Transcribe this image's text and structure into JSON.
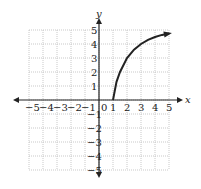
{
  "chart_data": {
    "type": "line",
    "title": "",
    "xlabel": "x",
    "ylabel": "y",
    "xlim": [
      -5,
      5
    ],
    "ylim": [
      -5,
      5
    ],
    "grid": true,
    "x_ticks": [
      "-5",
      "-4",
      "-3",
      "-2",
      "-1",
      "0",
      "1",
      "2",
      "3",
      "4",
      "5"
    ],
    "y_ticks": [
      "5",
      "4",
      "3",
      "2",
      "1",
      "-1",
      "-2",
      "-3",
      "-4",
      "-5"
    ],
    "series": [
      {
        "name": "curve",
        "x": [
          1,
          1.25,
          1.5,
          2,
          2.5,
          3,
          3.5,
          4,
          4.5,
          5
        ],
        "y": [
          0,
          1.3,
          2.0,
          3.0,
          3.6,
          4.0,
          4.3,
          4.5,
          4.65,
          4.75
        ],
        "start_point": [
          1,
          0
        ],
        "end_arrow": true
      }
    ]
  },
  "labels": {
    "x_axis": "x",
    "y_axis": "y",
    "origin": "0",
    "x_neg": [
      "−5",
      "−4",
      "−3",
      "−2",
      "−1"
    ],
    "x_pos": [
      "1",
      "2",
      "3",
      "4",
      "5"
    ],
    "y_pos": [
      "1",
      "2",
      "3",
      "4",
      "5"
    ],
    "y_neg": [
      "−1",
      "−2",
      "−3",
      "−4",
      "−5"
    ]
  }
}
